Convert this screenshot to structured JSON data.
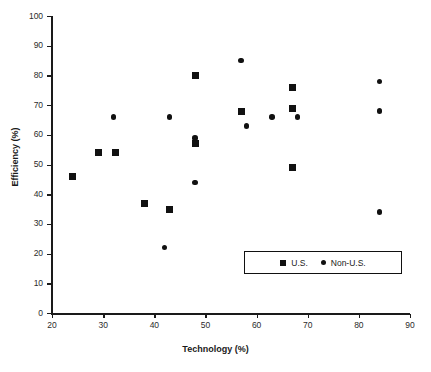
{
  "chart_data": {
    "type": "scatter",
    "title": "",
    "xlabel": "Technology (%)",
    "ylabel": "Efficiency (%)",
    "xlim": [
      20,
      90
    ],
    "ylim": [
      0,
      100
    ],
    "xticks": [
      20,
      30,
      40,
      50,
      60,
      70,
      80,
      90
    ],
    "yticks": [
      0,
      10,
      20,
      30,
      40,
      50,
      60,
      70,
      80,
      90,
      100
    ],
    "grid": false,
    "legend_position": "lower right",
    "series": [
      {
        "name": "U.S.",
        "marker": "square",
        "color": "#111111",
        "points": [
          {
            "x": 24,
            "y": 46
          },
          {
            "x": 29,
            "y": 54
          },
          {
            "x": 32.5,
            "y": 54
          },
          {
            "x": 38,
            "y": 37
          },
          {
            "x": 43,
            "y": 35
          },
          {
            "x": 48,
            "y": 80
          },
          {
            "x": 48,
            "y": 57
          },
          {
            "x": 57,
            "y": 68
          },
          {
            "x": 67,
            "y": 76
          },
          {
            "x": 67,
            "y": 69
          },
          {
            "x": 67,
            "y": 49
          }
        ]
      },
      {
        "name": "Non-U.S.",
        "marker": "circle",
        "color": "#111111",
        "points": [
          {
            "x": 32,
            "y": 66
          },
          {
            "x": 42,
            "y": 22
          },
          {
            "x": 43,
            "y": 66
          },
          {
            "x": 48,
            "y": 59
          },
          {
            "x": 48,
            "y": 44
          },
          {
            "x": 57,
            "y": 85
          },
          {
            "x": 58,
            "y": 63
          },
          {
            "x": 63,
            "y": 66
          },
          {
            "x": 68,
            "y": 66
          },
          {
            "x": 84,
            "y": 78
          },
          {
            "x": 84,
            "y": 68
          },
          {
            "x": 84,
            "y": 34
          }
        ]
      }
    ]
  },
  "legend": {
    "entries": [
      {
        "label": "U.S.",
        "marker": "square"
      },
      {
        "label": "Non-U.S.",
        "marker": "circle"
      }
    ]
  }
}
